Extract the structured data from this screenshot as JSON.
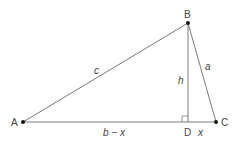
{
  "diagram": {
    "type": "triangle-with-altitude",
    "colors": {
      "line": "#7a7a7a",
      "point": "#111111",
      "text": "#444444"
    },
    "points": {
      "A": {
        "label": "A",
        "x": 23,
        "y": 122
      },
      "B": {
        "label": "B",
        "x": 188,
        "y": 23
      },
      "C": {
        "label": "C",
        "x": 216,
        "y": 122
      },
      "D": {
        "label": "D",
        "x": 188,
        "y": 122
      }
    },
    "segments": {
      "c": {
        "label": "c",
        "from": "A",
        "to": "B"
      },
      "a": {
        "label": "a",
        "from": "B",
        "to": "C"
      },
      "h": {
        "label": "h",
        "from": "B",
        "to": "D"
      },
      "b_minus_x": {
        "label": "b − x",
        "from": "A",
        "to": "D"
      },
      "x": {
        "label": "x",
        "from": "D",
        "to": "C"
      }
    },
    "right_angle_at": "D"
  }
}
